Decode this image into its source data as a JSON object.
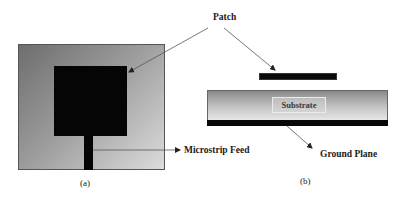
{
  "figure": {
    "panel_a": {
      "caption": "(a)",
      "view": "top",
      "labels": {
        "microstrip_feed": "Microstrip Feed"
      }
    },
    "panel_b": {
      "caption": "(b)",
      "view": "side",
      "labels": {
        "patch": "Patch",
        "substrate": "Substrate",
        "ground_plane": "Ground Plane"
      }
    },
    "colors": {
      "conductor": "#050505",
      "substrate_dark": "#6e6e6e",
      "substrate_light": "#dcdcdc",
      "arrow": "#444444"
    }
  }
}
